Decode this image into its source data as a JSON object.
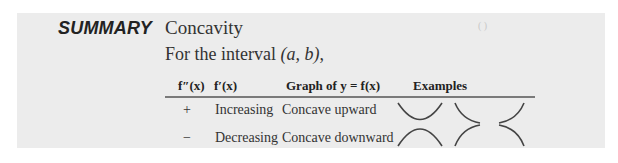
{
  "summary": {
    "label": "SUMMARY",
    "title": "Concavity",
    "intro_prefix": "For the interval ",
    "intro_interval": "(a, b)",
    "intro_suffix": ","
  },
  "table": {
    "headers": [
      "f″(x)",
      "f′(x)",
      "Graph of y = f(x)",
      "Examples"
    ],
    "rows": [
      {
        "second_derivative_sign": "+",
        "first_derivative": "Increasing",
        "graph": "Concave upward",
        "examples": [
          "concave-up-valley",
          "concave-up-decreasing",
          "concave-up-increasing"
        ]
      },
      {
        "second_derivative_sign": "−",
        "first_derivative": "Decreasing",
        "graph": "Concave downward",
        "examples": [
          "concave-down-hill",
          "concave-down-increasing",
          "concave-down-decreasing"
        ]
      }
    ]
  },
  "colors": {
    "panel_background": "#ececec",
    "rule": "#7a7a7a",
    "text": "#2a2a2a"
  }
}
